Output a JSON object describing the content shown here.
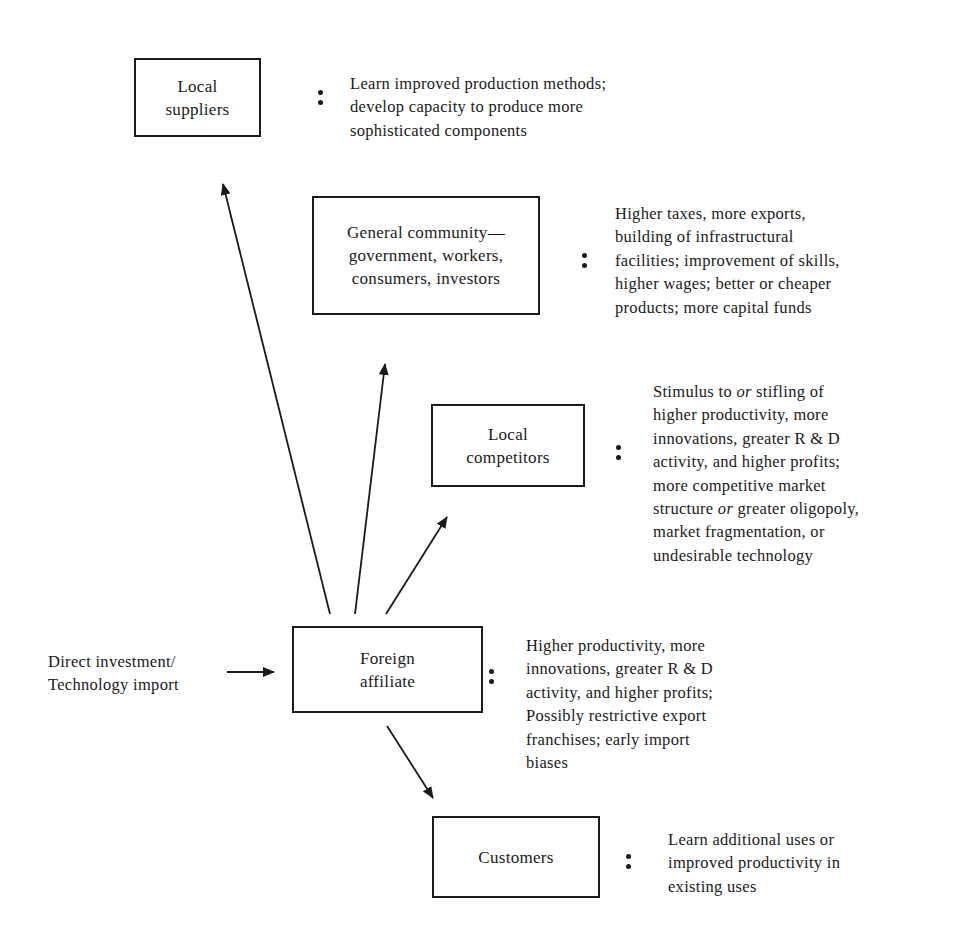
{
  "diagram": {
    "input": {
      "label": "Direct investment/\nTechnology import"
    },
    "center": {
      "label": "Foreign\naffiliate",
      "effects": "Higher productivity, more\ninnovations, greater R & D\nactivity, and higher profits;\nPossibly restrictive export\nfranchises; early import\nbiases"
    },
    "nodes": [
      {
        "id": "local-suppliers",
        "label": "Local\nsuppliers",
        "effects": "Learn improved production methods;\ndevelop capacity to produce more\nsophisticated components"
      },
      {
        "id": "general-community",
        "label": "General community—\ngovernment, workers,\nconsumers, investors",
        "effects": "Higher taxes, more exports,\nbuilding of infrastructural\nfacilities; improvement of skills,\nhigher wages; better or cheaper\nproducts; more capital funds"
      },
      {
        "id": "local-competitors",
        "label": "Local\ncompetitors",
        "effects_parts": [
          "Stimulus to ",
          "or",
          " stifling of\nhigher productivity, more\ninnovations, greater R & D\nactivity, and higher profits;\nmore competitive market\nstructure ",
          "or",
          " greater oligopoly,\nmarket fragmentation, or\nundesirable technology"
        ]
      },
      {
        "id": "customers",
        "label": "Customers",
        "effects": "Learn additional uses or\nimproved productivity in\nexisting uses"
      }
    ],
    "edges": [
      {
        "from": "input",
        "to": "foreign-affiliate"
      },
      {
        "from": "foreign-affiliate",
        "to": "local-suppliers"
      },
      {
        "from": "foreign-affiliate",
        "to": "general-community"
      },
      {
        "from": "foreign-affiliate",
        "to": "local-competitors"
      },
      {
        "from": "foreign-affiliate",
        "to": "customers"
      }
    ],
    "colors": {
      "ink": "#1a1a1a",
      "background": "#ffffff"
    }
  }
}
